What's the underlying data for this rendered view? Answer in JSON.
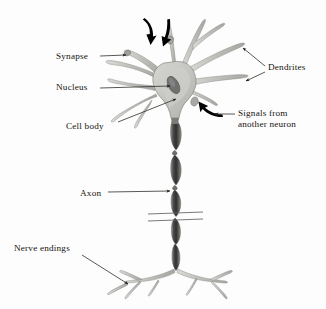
{
  "figure": {
    "background_color": "#fdfdfd",
    "text_color": "#15140f",
    "cell_fill_color": "#c8c8c4",
    "cell_stroke_color": "#8d8d88",
    "nucleus_color": "#6f6f6c",
    "axon_dark_color": "#4a4a48",
    "arrow_color": "#000000",
    "leader_color": "#3a3a38"
  },
  "labels": {
    "synapse": "Synapse",
    "nucleus": "Nucleus",
    "cell_body": "Cell body",
    "axon": "Axon",
    "nerve_endings": "Nerve endings",
    "dendrites": "Dendrites",
    "signals_line1": "Signals from",
    "signals_line2": "another neuron"
  },
  "annotations": {
    "incoming_signal_arrows": 3,
    "axon_break_marks": 2
  }
}
